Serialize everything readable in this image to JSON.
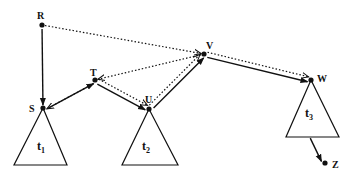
{
  "diagram": {
    "type": "tree-traversal",
    "colors": {
      "ink": "#111111",
      "background": "#ffffff"
    },
    "nodes": [
      {
        "id": "R",
        "label": "R",
        "x": 42,
        "y": 25,
        "lx": 37,
        "ly": 19
      },
      {
        "id": "S",
        "label": "S",
        "x": 43,
        "y": 108,
        "lx": 29,
        "ly": 112
      },
      {
        "id": "T",
        "label": "T",
        "x": 95,
        "y": 80,
        "lx": 90,
        "ly": 76
      },
      {
        "id": "U",
        "label": "U",
        "x": 149,
        "y": 109,
        "lx": 145,
        "ly": 103
      },
      {
        "id": "V",
        "label": "V",
        "x": 204,
        "y": 54,
        "lx": 206,
        "ly": 49
      },
      {
        "id": "W",
        "label": "W",
        "x": 311,
        "y": 80,
        "lx": 317,
        "ly": 82
      },
      {
        "id": "Z",
        "label": "Z",
        "x": 325,
        "y": 163,
        "lx": 332,
        "ly": 168
      }
    ],
    "subtrees": [
      {
        "id": "t1",
        "label": "t",
        "sub": "1",
        "apex": [
          43,
          108
        ],
        "base_left": [
          14,
          165
        ],
        "base_right": [
          67,
          165
        ],
        "lx": 37,
        "ly": 150
      },
      {
        "id": "t2",
        "label": "t",
        "sub": "2",
        "apex": [
          149,
          109
        ],
        "base_left": [
          122,
          165
        ],
        "base_right": [
          178,
          165
        ],
        "lx": 142,
        "ly": 150
      },
      {
        "id": "t3",
        "label": "t",
        "sub": "3",
        "apex": [
          311,
          80
        ],
        "base_left": [
          286,
          137
        ],
        "base_right": [
          339,
          137
        ],
        "lx": 305,
        "ly": 117
      }
    ],
    "solid_edges": [
      {
        "from": "R",
        "to": "S",
        "arrow": true
      },
      {
        "from": "S",
        "to": "T",
        "arrow": true
      },
      {
        "from": "T",
        "to": "U",
        "arrow": true
      },
      {
        "from": "U",
        "to": "V",
        "arrow": true
      },
      {
        "from": "V",
        "to": "W",
        "arrow": true
      },
      {
        "from": "t3",
        "to": "Z",
        "arrow": true
      }
    ],
    "dotted_edges": [
      {
        "from": "R",
        "to": "V",
        "arrow": true
      },
      {
        "from": "V",
        "to": "T",
        "arrow": true
      },
      {
        "from": "T",
        "to": "S",
        "arrow": true
      },
      {
        "from": "T",
        "to": "U",
        "arrow": true
      },
      {
        "from": "U",
        "to": "V",
        "arrow": true
      },
      {
        "from": "V",
        "to": "W",
        "arrow": true
      }
    ]
  }
}
